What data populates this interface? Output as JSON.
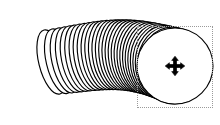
{
  "app": {
    "canvas_background": "#ffffff",
    "width": 220,
    "height": 125
  },
  "artwork": {
    "name": "coil-of-circles",
    "description": "Swept coil made of many overlapping outlined circles forming a tube",
    "stroke_color": "#000000",
    "fill_color": "#ffffff",
    "ring_count": 31,
    "path_start": {
      "x": 52,
      "y": 62
    },
    "path_end": {
      "x": 175,
      "y": 66
    },
    "radius_start": 33,
    "radius_end": 38
  },
  "selection": {
    "name": "selection-bounding-box",
    "style": "dotted",
    "color": "#9a9a9a",
    "x": 137,
    "y": 26,
    "width": 76,
    "height": 82
  },
  "cursor": {
    "name": "move-cursor",
    "icon": "move-four-arrows-icon",
    "color": "#000000",
    "x": 175,
    "y": 66
  }
}
